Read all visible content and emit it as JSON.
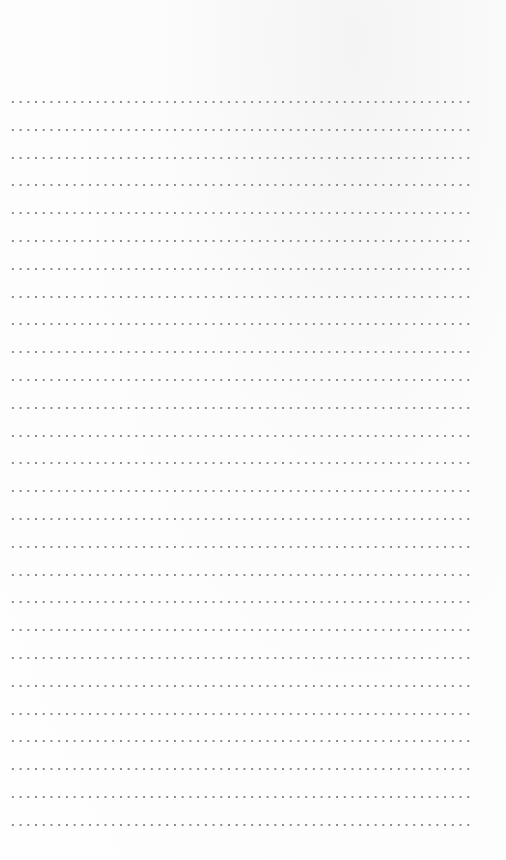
{
  "page": {
    "type": "dotted-lined-paper",
    "line_count": 27,
    "dot_color": "#8a8a8a",
    "background_color": "#fdfdfd",
    "text": ""
  }
}
